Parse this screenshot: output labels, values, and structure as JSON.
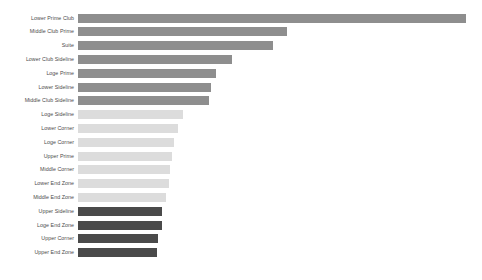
{
  "chart_data": {
    "type": "bar",
    "orientation": "horizontal",
    "title": "",
    "subtitle": "",
    "xlabel": "",
    "ylabel": "",
    "grid": false,
    "legend": "none",
    "axis_visible": false,
    "tick_labels_x": [],
    "xlim": [
      0,
      100
    ],
    "categories": [
      "Lower Prime Club",
      "Middle Club Prime",
      "Suite",
      "Lower Club Sideline",
      "Loge Prime",
      "Lower Sideline",
      "Middle Club Sideline",
      "Loge Sideline",
      "Lower Corner",
      "Loge Corner",
      "Upper Prime",
      "Middle Corner",
      "Lower End Zone",
      "Middle End Zone",
      "Upper Sideline",
      "Loge End Zone",
      "Upper Corner",
      "Upper End Zone"
    ],
    "values": [
      100.0,
      53.9,
      50.3,
      39.7,
      35.6,
      34.3,
      33.8,
      27.1,
      25.8,
      24.7,
      24.2,
      23.7,
      23.5,
      22.7,
      21.7,
      21.7,
      20.6,
      20.4
    ],
    "bar_colors": [
      "#8e8e8e",
      "#8e8e8e",
      "#8e8e8e",
      "#8e8e8e",
      "#8e8e8e",
      "#8e8e8e",
      "#8e8e8e",
      "#dcdcdc",
      "#dcdcdc",
      "#dcdcdc",
      "#dcdcdc",
      "#dcdcdc",
      "#dcdcdc",
      "#dcdcdc",
      "#4a4a4a",
      "#4a4a4a",
      "#4a4a4a",
      "#4a4a4a"
    ],
    "color_groups": {
      "medium": "#8e8e8e",
      "light": "#dcdcdc",
      "dark": "#4a4a4a"
    },
    "background": "#ffffff",
    "label_color": "#4b4b4b"
  }
}
